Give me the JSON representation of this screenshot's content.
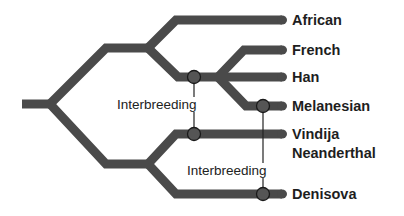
{
  "diagram": {
    "type": "phylogenetic-tree",
    "branch_color": "#4a4a4a",
    "taxa": [
      {
        "id": "african",
        "label": "African"
      },
      {
        "id": "french",
        "label": "French"
      },
      {
        "id": "han",
        "label": "Han"
      },
      {
        "id": "melanesian",
        "label": "Melanesian"
      },
      {
        "id": "vindija",
        "label_line1": "Vindija",
        "label_line2": "Neanderthal"
      },
      {
        "id": "denisova",
        "label": "Denisova"
      }
    ],
    "interbreeding_events": [
      {
        "label": "Interbreeding",
        "from": "french/han ancestor",
        "to": "vindija"
      },
      {
        "label": "Interbreeding",
        "from": "melanesian",
        "to": "denisova"
      }
    ]
  }
}
